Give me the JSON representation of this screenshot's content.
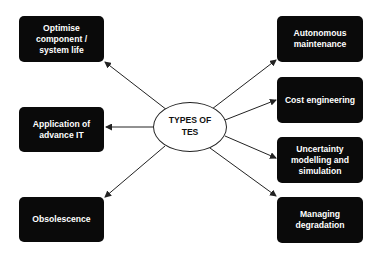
{
  "diagram": {
    "center": {
      "label": "TYPES OF\nTES"
    },
    "left_nodes": [
      {
        "label": "Optimise\ncomponent /\nsystem life"
      },
      {
        "label": "Application of\nadvance IT"
      },
      {
        "label": "Obsolescence"
      }
    ],
    "right_nodes": [
      {
        "label": "Autonomous\nmaintenance"
      },
      {
        "label": "Cost engineering"
      },
      {
        "label": "Uncertainty\nmodelling and\nsimulation"
      },
      {
        "label": "Managing\ndegradation"
      }
    ],
    "edges": [
      {
        "from": "TYPES OF TES",
        "to": "Optimise component / system life"
      },
      {
        "from": "TYPES OF TES",
        "to": "Application of advance IT"
      },
      {
        "from": "TYPES OF TES",
        "to": "Obsolescence"
      },
      {
        "from": "TYPES OF TES",
        "to": "Autonomous maintenance"
      },
      {
        "from": "TYPES OF TES",
        "to": "Cost engineering"
      },
      {
        "from": "TYPES OF TES",
        "to": "Uncertainty modelling and simulation"
      },
      {
        "from": "TYPES OF TES",
        "to": "Managing degradation"
      }
    ],
    "colors": {
      "node_fill": "#0a0a0a",
      "node_text": "#ffffff",
      "edge": "#222222",
      "center_fill": "#ffffff"
    }
  }
}
